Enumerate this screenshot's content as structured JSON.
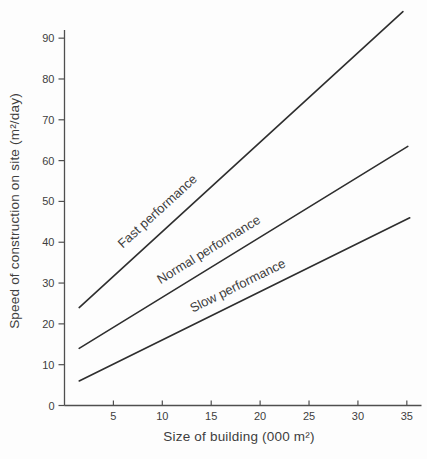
{
  "chart_data": {
    "type": "line",
    "title": "",
    "xlabel": "Size of building (000 m²)",
    "ylabel": "Speed of construction on site (m²/day)",
    "xlim": [
      0,
      36.5
    ],
    "ylim": [
      0,
      92
    ],
    "x_ticks": [
      5,
      10,
      15,
      20,
      25,
      30,
      35
    ],
    "y_ticks": [
      0,
      10,
      20,
      30,
      40,
      50,
      60,
      70,
      80,
      90
    ],
    "grid": false,
    "legend": "inline rotated labels above each line",
    "series": [
      {
        "name": "Fast performance",
        "x": [
          1.5,
          34.6
        ],
        "y": [
          24,
          96.5
        ],
        "label_t": 0.28,
        "label_offset": 14
      },
      {
        "name": "Normal performance",
        "x": [
          1.5,
          35.1
        ],
        "y": [
          14,
          63.5
        ],
        "label_t": 0.42,
        "label_offset": 12
      },
      {
        "name": "Slow performance",
        "x": [
          1.5,
          35.3
        ],
        "y": [
          6,
          46
        ],
        "label_t": 0.5,
        "label_offset": 11
      }
    ],
    "colors": {
      "line": "#2e2e2e",
      "axis": "#4f4f4f",
      "text": "#3e3e3e",
      "background": "#fdfdfd"
    },
    "layout": {
      "plot_left": 64.5,
      "plot_right": 421.5,
      "plot_top": 30,
      "plot_bottom": 405.5,
      "tick_len_x": 5,
      "tick_len_y": 6,
      "x_title_x": 239,
      "x_title_y": 441,
      "y_title_x": 19,
      "y_title_y": 211
    }
  }
}
